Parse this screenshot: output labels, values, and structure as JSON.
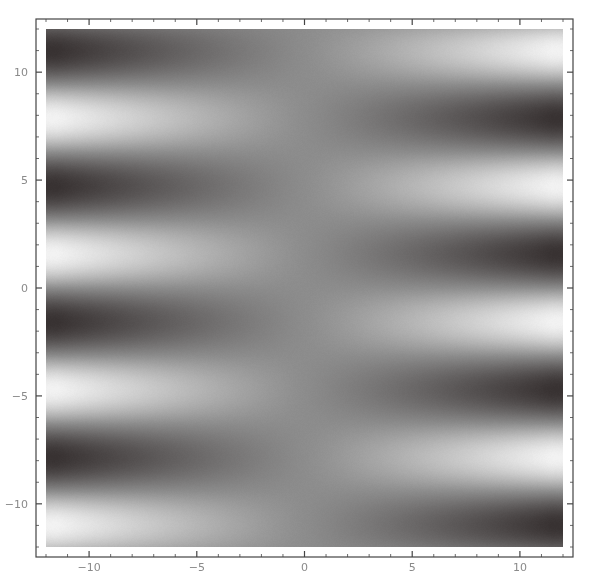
{
  "chart_data": {
    "type": "heatmap",
    "subtype": "density_plot",
    "title": "",
    "xlabel": "",
    "ylabel": "",
    "xlim": [
      -12,
      12
    ],
    "ylim": [
      -12,
      12
    ],
    "grid": false,
    "legend": null,
    "colormap": "grayscale",
    "color_low": "#383232",
    "color_high": "#f2f2f2",
    "color_mid": "#8c8c8c",
    "function_description": "horizontal banded pattern ~ (x/12)·sin(y); left half light where sin(y)=-1, right half inverted; uniform gray along x=0",
    "x_ticks": [
      {
        "value": -10,
        "label": "−10"
      },
      {
        "value": -5,
        "label": "−5"
      },
      {
        "value": 0,
        "label": "0"
      },
      {
        "value": 5,
        "label": "5"
      },
      {
        "value": 10,
        "label": "10"
      }
    ],
    "y_ticks": [
      {
        "value": 10,
        "label": "10"
      },
      {
        "value": 5,
        "label": "5"
      },
      {
        "value": 0,
        "label": "0"
      },
      {
        "value": -5,
        "label": "−5"
      },
      {
        "value": -10,
        "label": "−10"
      }
    ],
    "band_samples_left_x_-11": [
      {
        "y": 11.2,
        "shade": "light"
      },
      {
        "y": 8.3,
        "shade": "dark"
      },
      {
        "y": 5.0,
        "shade": "light"
      },
      {
        "y": 2.2,
        "shade": "dark"
      },
      {
        "y": -1.8,
        "shade": "light"
      },
      {
        "y": -4.7,
        "shade": "dark"
      },
      {
        "y": -7.9,
        "shade": "light"
      },
      {
        "y": -10.8,
        "shade": "dark"
      }
    ],
    "band_samples_right_x_11": [
      {
        "y": 11.1,
        "shade": "dark"
      },
      {
        "y": 8.0,
        "shade": "light"
      },
      {
        "y": 4.8,
        "shade": "dark"
      },
      {
        "y": 2.0,
        "shade": "light"
      },
      {
        "y": -1.6,
        "shade": "dark"
      },
      {
        "y": -4.7,
        "shade": "light"
      },
      {
        "y": -7.9,
        "shade": "dark"
      },
      {
        "y": -10.8,
        "shade": "light"
      }
    ]
  },
  "layout": {
    "frame": {
      "left": 36,
      "top": 19,
      "right": 573,
      "bottom": 557
    },
    "plot_area": {
      "left": 46,
      "top": 29,
      "right": 563,
      "bottom": 547
    },
    "frame_color": "#444444",
    "tick_label_color": "#8a8a8a"
  }
}
